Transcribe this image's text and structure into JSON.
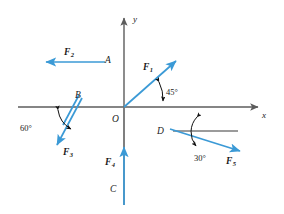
{
  "figure": {
    "background_color": "#ffffff",
    "axis_color": "#5c5c5c",
    "vector_color": "#3b9ad6",
    "annotation_color": "#111111"
  },
  "axes": {
    "x_label": "x",
    "y_label": "y",
    "origin_label": "O",
    "origin": {
      "x": 124,
      "y": 107
    },
    "x_range_px": [
      18,
      262
    ],
    "y_range_px": [
      14,
      207
    ]
  },
  "points": [
    {
      "name": "A",
      "label": "A",
      "x": 108,
      "y": 60
    },
    {
      "name": "B",
      "label": "B",
      "x": 78,
      "y": 99
    },
    {
      "name": "C",
      "label": "C",
      "x": 113,
      "y": 188
    },
    {
      "name": "D",
      "label": "D",
      "x": 161,
      "y": 131
    },
    {
      "name": "O",
      "label": "O",
      "x": 116,
      "y": 118
    }
  ],
  "forces": [
    {
      "id": "F1",
      "label": "F",
      "subscript": "1",
      "applied_at": "O",
      "direction": "up-right",
      "angle_from_x_axis_deg": 45,
      "tail": {
        "x": 124,
        "y": 107
      },
      "head": {
        "x": 178,
        "y": 59
      },
      "label_pos": {
        "x": 146,
        "y": 68
      }
    },
    {
      "id": "F2",
      "label": "F",
      "subscript": "2",
      "applied_at": "A",
      "direction": "left (negative x)",
      "angle_from_x_axis_deg": 180,
      "tail": {
        "x": 105,
        "y": 62
      },
      "head": {
        "x": 43,
        "y": 62
      },
      "label_pos": {
        "x": 68,
        "y": 53
      }
    },
    {
      "id": "F3",
      "label": "F",
      "subscript": "3",
      "applied_at": "B",
      "direction": "down-left",
      "angle_from_neg_x_axis_deg": 60,
      "tail": {
        "x": 82,
        "y": 98
      },
      "head": {
        "x": 55,
        "y": 148
      },
      "label_pos": {
        "x": 66,
        "y": 152
      }
    },
    {
      "id": "F4",
      "label": "F",
      "subscript": "4",
      "applied_at": "C",
      "direction": "up (positive y)",
      "angle_from_x_axis_deg": 90,
      "tail": {
        "x": 124,
        "y": 205
      },
      "head": {
        "x": 124,
        "y": 144
      },
      "label_pos": {
        "x": 108,
        "y": 161
      }
    },
    {
      "id": "F5",
      "label": "F",
      "subscript": "5",
      "applied_at": "D",
      "direction": "down-right",
      "angle_from_horizontal_deg": 30,
      "tail": {
        "x": 170,
        "y": 129
      },
      "head": {
        "x": 243,
        "y": 152
      },
      "label_pos": {
        "x": 229,
        "y": 161
      }
    }
  ],
  "guide_lines": [
    {
      "name": "d-horizontal-reference",
      "from": {
        "x": 173,
        "y": 131
      },
      "to": {
        "x": 236,
        "y": 131
      }
    },
    {
      "name": "b-extension-line",
      "from": {
        "x": 78,
        "y": 96
      },
      "to": {
        "x": 62,
        "y": 126
      }
    },
    {
      "name": "o-to-c-axis-segment",
      "from": {
        "x": 124,
        "y": 107
      },
      "to": {
        "x": 124,
        "y": 147
      }
    }
  ],
  "angles": [
    {
      "id": "angle-45",
      "value": "45°",
      "between": [
        "F1",
        "positive x-axis"
      ],
      "vertex": {
        "x": 124,
        "y": 107
      },
      "label_pos": {
        "x": 166,
        "y": 92
      }
    },
    {
      "id": "angle-60",
      "value": "60°",
      "between": [
        "F3",
        "negative x-axis"
      ],
      "vertex": {
        "x": 78,
        "y": 100
      },
      "label_pos": {
        "x": 24,
        "y": 128
      }
    },
    {
      "id": "angle-30",
      "value": "30°",
      "between": [
        "F5",
        "horizontal reference at D"
      ],
      "vertex": {
        "x": 199,
        "y": 131
      },
      "label_pos": {
        "x": 200,
        "y": 158
      }
    }
  ]
}
